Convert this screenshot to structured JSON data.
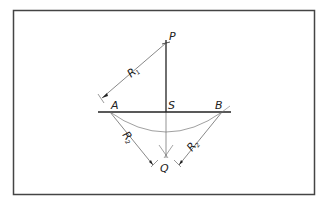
{
  "diagram": {
    "type": "geometric-construction",
    "colors": {
      "frame": "#444444",
      "thick_line": "#222222",
      "thin_line": "#555555",
      "arc": "#777777"
    },
    "labels": {
      "P": "P",
      "S": "S",
      "A": "A",
      "B": "B",
      "Q": "Q",
      "R1": "R",
      "R1_sub": "1",
      "R2_left": "R",
      "R2_left_sub": "2",
      "R2_right": "R",
      "R2_right_sub": "2"
    },
    "points": {
      "P": [
        166,
        43
      ],
      "S": [
        166,
        112
      ],
      "A": [
        110,
        112
      ],
      "B": [
        222,
        112
      ],
      "Q": [
        166,
        155
      ]
    }
  }
}
